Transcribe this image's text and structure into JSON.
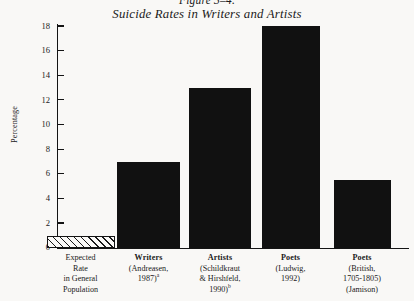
{
  "figure": {
    "number": "Figure 3–4.",
    "title": "Suicide Rates in Writers and Artists"
  },
  "chart_data": {
    "type": "bar",
    "title": "Suicide Rates in Writers and Artists",
    "xlabel": "",
    "ylabel": "Percentage",
    "ylim": [
      0,
      18
    ],
    "ytick_labels": [
      "18",
      "16",
      "14",
      "12",
      "10",
      "8",
      "6",
      "4",
      "2",
      "0"
    ],
    "yticks": [
      18,
      16,
      14,
      12,
      10,
      8,
      6,
      4,
      2,
      0
    ],
    "grid": false,
    "legend": "none",
    "categories": [
      "Expected Rate in General Population",
      "Writers (Andreasen, 1987)a",
      "Artists (Schildkraut & Hirshfeld, 1990)b",
      "Poets (Ludwig, 1992)",
      "Poets (British, 1705-1805) (Jamison)"
    ],
    "values": [
      1.0,
      7.0,
      13.0,
      18.0,
      5.5
    ],
    "bar_styles": [
      "hatched",
      "solid",
      "solid",
      "solid",
      "solid"
    ],
    "bar_color": "#111111",
    "background_color": "#f9f8f6"
  },
  "categories": [
    {
      "name": "expected-rate",
      "lines": [
        "Expected",
        "Rate",
        "in General",
        "Population"
      ],
      "bold_first": false,
      "superscript": "",
      "value": 1.0,
      "style": "hatched"
    },
    {
      "name": "writers",
      "lines": [
        "Writers",
        "(Andreasen,",
        "1987)"
      ],
      "bold_first": true,
      "superscript": "a",
      "value": 7.0,
      "style": "solid"
    },
    {
      "name": "artists",
      "lines": [
        "Artists",
        "(Schildkraut",
        "& Hirshfeld,",
        "1990)"
      ],
      "bold_first": true,
      "superscript": "b",
      "value": 13.0,
      "style": "solid"
    },
    {
      "name": "poets-ludwig",
      "lines": [
        "Poets",
        "(Ludwig,",
        "1992)"
      ],
      "bold_first": true,
      "superscript": "",
      "value": 18.0,
      "style": "solid"
    },
    {
      "name": "poets-british",
      "lines": [
        "Poets",
        "(British,",
        "1705-1805)",
        "(Jamison)"
      ],
      "bold_first": true,
      "superscript": "",
      "value": 5.5,
      "style": "solid"
    }
  ]
}
